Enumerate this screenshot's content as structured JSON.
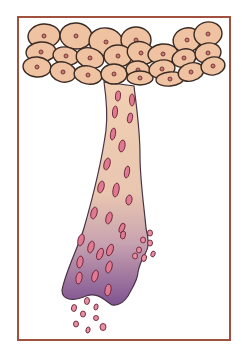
{
  "figure": {
    "frame_color": "#a0523f",
    "colors": {
      "cell_fill": "#efc3a2",
      "cell_stroke": "#3a2a24",
      "nucleus_fill": "#c97a6a",
      "nucleus_stroke": "#6a2f38",
      "stalk_top": "#f1d0b3",
      "stalk_mid": "#d9b6b4",
      "stalk_bottom": "#8a5c96",
      "stalk_stroke": "#4a3446",
      "inclusion_fill": "#e07a92",
      "inclusion_stroke": "#6b2437",
      "shed_fill": "#e890a4",
      "shed_stroke": "#6b2437"
    },
    "top_cells": [
      {
        "cx": 44,
        "cy": 36,
        "rx": 16,
        "ry": 12,
        "rot": -5
      },
      {
        "cx": 76,
        "cy": 36,
        "rx": 16,
        "ry": 13,
        "rot": 5
      },
      {
        "cx": 106,
        "cy": 42,
        "rx": 17,
        "ry": 14,
        "rot": 10
      },
      {
        "cx": 136,
        "cy": 40,
        "rx": 15,
        "ry": 13,
        "rot": 0
      },
      {
        "cx": 187,
        "cy": 40,
        "rx": 14,
        "ry": 12,
        "rot": -15
      },
      {
        "cx": 208,
        "cy": 34,
        "rx": 14,
        "ry": 12,
        "rot": -10
      },
      {
        "cx": 41,
        "cy": 52,
        "rx": 15,
        "ry": 10,
        "rot": -5
      },
      {
        "cx": 66,
        "cy": 56,
        "rx": 13,
        "ry": 9,
        "rot": 10
      },
      {
        "cx": 90,
        "cy": 58,
        "rx": 14,
        "ry": 10,
        "rot": 15
      },
      {
        "cx": 118,
        "cy": 56,
        "rx": 14,
        "ry": 11,
        "rot": 0
      },
      {
        "cx": 141,
        "cy": 53,
        "rx": 14,
        "ry": 11,
        "rot": 20
      },
      {
        "cx": 163,
        "cy": 54,
        "rx": 15,
        "ry": 10,
        "rot": -5
      },
      {
        "cx": 184,
        "cy": 58,
        "rx": 12,
        "ry": 9,
        "rot": -15
      },
      {
        "cx": 208,
        "cy": 53,
        "rx": 13,
        "ry": 10,
        "rot": -10
      },
      {
        "cx": 37,
        "cy": 67,
        "rx": 14,
        "ry": 10,
        "rot": 5
      },
      {
        "cx": 63,
        "cy": 72,
        "rx": 13,
        "ry": 10,
        "rot": 15
      },
      {
        "cx": 88,
        "cy": 75,
        "rx": 14,
        "ry": 9,
        "rot": 10
      },
      {
        "cx": 114,
        "cy": 74,
        "rx": 13,
        "ry": 10,
        "rot": 0
      },
      {
        "cx": 138,
        "cy": 70,
        "rx": 12,
        "ry": 9,
        "rot": 5
      },
      {
        "cx": 140,
        "cy": 78,
        "rx": 13,
        "ry": 7,
        "rot": 0
      },
      {
        "cx": 162,
        "cy": 69,
        "rx": 13,
        "ry": 9,
        "rot": -10
      },
      {
        "cx": 170,
        "cy": 79,
        "rx": 14,
        "ry": 7,
        "rot": -5
      },
      {
        "cx": 191,
        "cy": 72,
        "rx": 13,
        "ry": 9,
        "rot": -15
      },
      {
        "cx": 213,
        "cy": 66,
        "rx": 12,
        "ry": 9,
        "rot": -10
      }
    ],
    "inclusions": [
      {
        "cx": 118,
        "cy": 96,
        "rx": 2.5,
        "ry": 5,
        "rot": 5
      },
      {
        "cx": 132,
        "cy": 100,
        "rx": 2.5,
        "ry": 6,
        "rot": 0
      },
      {
        "cx": 115,
        "cy": 112,
        "rx": 2.5,
        "ry": 6,
        "rot": 5
      },
      {
        "cx": 130,
        "cy": 118,
        "rx": 2.5,
        "ry": 5,
        "rot": 10
      },
      {
        "cx": 113,
        "cy": 134,
        "rx": 2.5,
        "ry": 6,
        "rot": 10
      },
      {
        "cx": 122,
        "cy": 146,
        "rx": 3,
        "ry": 6,
        "rot": 10
      },
      {
        "cx": 107,
        "cy": 164,
        "rx": 3,
        "ry": 6,
        "rot": 15
      },
      {
        "cx": 127,
        "cy": 172,
        "rx": 2.5,
        "ry": 6,
        "rot": 10
      },
      {
        "cx": 101,
        "cy": 187,
        "rx": 3,
        "ry": 6,
        "rot": 15
      },
      {
        "cx": 116,
        "cy": 190,
        "rx": 3,
        "ry": 7,
        "rot": 10
      },
      {
        "cx": 129,
        "cy": 200,
        "rx": 3,
        "ry": 5,
        "rot": 10
      },
      {
        "cx": 94,
        "cy": 213,
        "rx": 3,
        "ry": 6,
        "rot": 15
      },
      {
        "cx": 109,
        "cy": 218,
        "rx": 3,
        "ry": 6,
        "rot": 15
      },
      {
        "cx": 122,
        "cy": 228,
        "rx": 2.5,
        "ry": 5,
        "rot": 20
      },
      {
        "cx": 91,
        "cy": 247,
        "rx": 3,
        "ry": 6,
        "rot": 15
      },
      {
        "cx": 110,
        "cy": 250,
        "rx": 3,
        "ry": 6,
        "rot": 20
      },
      {
        "cx": 123,
        "cy": 235,
        "rx": 2.5,
        "ry": 4,
        "rot": 10
      },
      {
        "cx": 81,
        "cy": 240,
        "rx": 3,
        "ry": 6,
        "rot": 15
      },
      {
        "cx": 80,
        "cy": 262,
        "rx": 3,
        "ry": 6,
        "rot": 10
      },
      {
        "cx": 100,
        "cy": 254,
        "rx": 3,
        "ry": 6,
        "rot": 20
      },
      {
        "cx": 109,
        "cy": 267,
        "rx": 3,
        "ry": 6,
        "rot": 15
      },
      {
        "cx": 79,
        "cy": 278,
        "rx": 3,
        "ry": 6,
        "rot": 10
      },
      {
        "cx": 95,
        "cy": 276,
        "rx": 3,
        "ry": 6,
        "rot": 15
      },
      {
        "cx": 108,
        "cy": 290,
        "rx": 3,
        "ry": 6,
        "rot": 10
      }
    ],
    "shed_cells": [
      {
        "cx": 150,
        "cy": 233,
        "rx": 2.5,
        "ry": 3,
        "rot": 0
      },
      {
        "cx": 143,
        "cy": 240,
        "rx": 2.5,
        "ry": 3,
        "rot": 0
      },
      {
        "cx": 150,
        "cy": 243,
        "rx": 2.5,
        "ry": 3,
        "rot": 0
      },
      {
        "cx": 139,
        "cy": 250,
        "rx": 2.5,
        "ry": 3,
        "rot": 0
      },
      {
        "cx": 144,
        "cy": 258,
        "rx": 2.5,
        "ry": 3.5,
        "rot": 15
      },
      {
        "cx": 135,
        "cy": 256,
        "rx": 2.5,
        "ry": 3,
        "rot": 0
      },
      {
        "cx": 153,
        "cy": 254,
        "rx": 2,
        "ry": 3,
        "rot": 20
      },
      {
        "cx": 74,
        "cy": 308,
        "rx": 2.5,
        "ry": 3.5,
        "rot": 10
      },
      {
        "cx": 87,
        "cy": 301,
        "rx": 2.5,
        "ry": 3.5,
        "rot": 5
      },
      {
        "cx": 83,
        "cy": 314,
        "rx": 2.5,
        "ry": 3,
        "rot": 0
      },
      {
        "cx": 96,
        "cy": 307,
        "rx": 2,
        "ry": 3,
        "rot": 15
      },
      {
        "cx": 76,
        "cy": 324,
        "rx": 2.5,
        "ry": 3,
        "rot": 0
      },
      {
        "cx": 96,
        "cy": 318,
        "rx": 2.5,
        "ry": 2.5,
        "rot": 0
      },
      {
        "cx": 88,
        "cy": 330,
        "rx": 2,
        "ry": 3,
        "rot": 15
      },
      {
        "cx": 103,
        "cy": 327,
        "rx": 3,
        "ry": 3.5,
        "rot": 0
      }
    ]
  }
}
